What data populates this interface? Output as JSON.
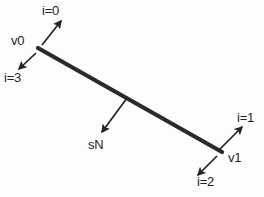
{
  "figure": {
    "background_color": "#fdfdfd",
    "stroke_color": "#232323",
    "edge_color": "#2a2a2a",
    "edge": {
      "start_label": "v0",
      "end_label": "v1",
      "start_point": [
        38,
        48
      ],
      "end_point": [
        222,
        152
      ],
      "thickness_px": 4
    },
    "labels": {
      "v0": "v0",
      "v1": "v1",
      "normal": "sN",
      "i0": "i=0",
      "i1": "i=1",
      "i2": "i=2",
      "i3": "i=3"
    },
    "arrows": [
      {
        "name": "i0-arrow",
        "label": "i=0",
        "from": [
          42,
          45
        ],
        "to": [
          62,
          20
        ],
        "direction": "up-right"
      },
      {
        "name": "i3-arrow",
        "label": "i=3",
        "from": [
          36,
          52
        ],
        "to": [
          18,
          70
        ],
        "direction": "down-left"
      },
      {
        "name": "i1-arrow",
        "label": "i=1",
        "from": [
          219,
          150
        ],
        "to": [
          243,
          126
        ],
        "direction": "up-right"
      },
      {
        "name": "i2-arrow",
        "label": "i=2",
        "from": [
          217,
          156
        ],
        "to": [
          197,
          176
        ],
        "direction": "down-left"
      },
      {
        "name": "normal-arrow",
        "label": "sN",
        "from": [
          126,
          99
        ],
        "to": [
          101,
          133
        ],
        "direction": "down-left"
      }
    ],
    "caption_fragment": ""
  }
}
